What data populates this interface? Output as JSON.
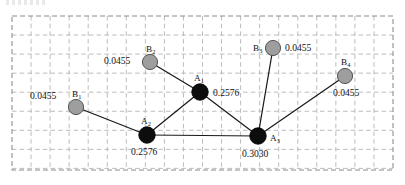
{
  "figure": {
    "title": "",
    "frame": {
      "x": 12,
      "y": 16,
      "width": 381,
      "height": 154,
      "grid_cell": 19.05,
      "grid_color": "#b4b4b4",
      "frame_color": "#8c8c8c",
      "grid_style": "dashed"
    },
    "colors": {
      "a_node_fill": "#0d0d0d",
      "a_node_stroke": "#000000",
      "b_node_fill": "#9e9e9e",
      "b_node_stroke": "#565656",
      "edge": "#1a1a1a",
      "text": "#141414",
      "background": "#ffffff"
    }
  },
  "chart_data": {
    "type": "scatter",
    "title": "",
    "xlabel": "",
    "ylabel": "",
    "grid": true,
    "legend": "none",
    "nodes": [
      {
        "id": "A1",
        "label": "A",
        "sub": "1",
        "group": "A",
        "value": "0.2576",
        "numeric_value": 0.2576,
        "x": 200,
        "y": 92,
        "r": 8.2,
        "label_dx": -6,
        "label_dy": -11,
        "value_dx": 13,
        "value_dy": 4
      },
      {
        "id": "A2",
        "label": "A",
        "sub": "2",
        "group": "A",
        "value": "0.2576",
        "numeric_value": 0.2576,
        "x": 147,
        "y": 135,
        "r": 8.2,
        "label_dx": -6,
        "label_dy": -11,
        "value_dx": -16,
        "value_dy": 20
      },
      {
        "id": "A3",
        "label": "A",
        "sub": "3",
        "group": "A",
        "value": "0.3030",
        "numeric_value": 0.303,
        "x": 258,
        "y": 136,
        "r": 8.2,
        "label_dx": 12,
        "label_dy": 5,
        "value_dx": -16,
        "value_dy": 21
      },
      {
        "id": "B1",
        "label": "B",
        "sub": "1",
        "group": "B",
        "value": "0.0455",
        "numeric_value": 0.0455,
        "x": 76,
        "y": 107,
        "r": 7.6,
        "label_dx": -4,
        "label_dy": -10,
        "value_dx": -46,
        "value_dy": -8
      },
      {
        "id": "B2",
        "label": "B",
        "sub": "2",
        "group": "B",
        "value": "0.0455",
        "numeric_value": 0.0455,
        "x": 150,
        "y": 62,
        "r": 7.6,
        "label_dx": -4,
        "label_dy": -10,
        "value_dx": -46,
        "value_dy": 2
      },
      {
        "id": "B3",
        "label": "B",
        "sub": "3",
        "group": "B",
        "value": "0.0455",
        "numeric_value": 0.0455,
        "x": 273,
        "y": 48,
        "r": 7.6,
        "label_dx": -20,
        "label_dy": 3,
        "value_dx": 12,
        "value_dy": 3
      },
      {
        "id": "B4",
        "label": "B",
        "sub": "4",
        "group": "B",
        "value": "0.0455",
        "numeric_value": 0.0455,
        "x": 345,
        "y": 76,
        "r": 7.6,
        "label_dx": -4,
        "label_dy": -11,
        "value_dx": -12,
        "value_dy": 20
      }
    ],
    "edges": [
      {
        "source": "B1",
        "target": "A2"
      },
      {
        "source": "B2",
        "target": "A1"
      },
      {
        "source": "A1",
        "target": "A2"
      },
      {
        "source": "A1",
        "target": "A3"
      },
      {
        "source": "A2",
        "target": "A3"
      },
      {
        "source": "B3",
        "target": "A3"
      },
      {
        "source": "B4",
        "target": "A3"
      }
    ],
    "value_labels": [
      "0.0455",
      "0.0455",
      "0.2576",
      "0.0455",
      "0.2576",
      "0.3030",
      "0.0455"
    ],
    "node_labels": [
      "B1",
      "B2",
      "A1",
      "B3",
      "B4",
      "A2",
      "A3"
    ]
  }
}
